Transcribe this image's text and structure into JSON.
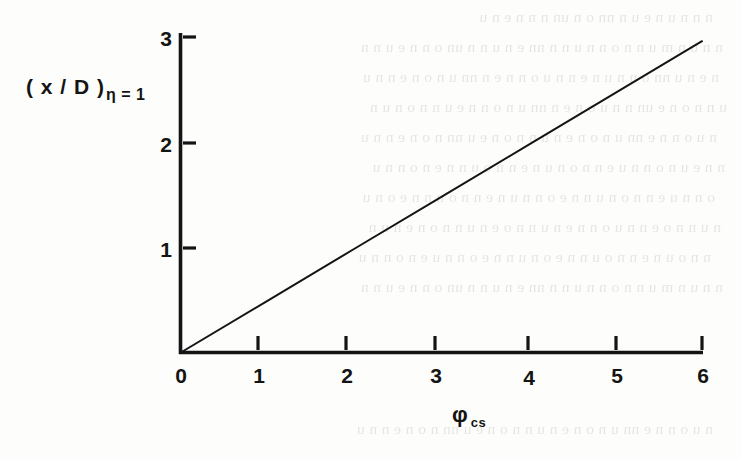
{
  "figure": {
    "background_color": "#fdfdfc",
    "ink_color": "#141414",
    "width": 741,
    "height": 459
  },
  "axes": {
    "y_title_main": "( x / D )",
    "y_title_subscript": "η = 1",
    "x_title_main": "φ",
    "x_title_subscript": "cs",
    "x_ticks": [
      "0",
      "1",
      "2",
      "3",
      "4",
      "5",
      "6"
    ],
    "y_ticks": [
      "1",
      "2",
      "3"
    ]
  },
  "ghost_text": {
    "note": "faint bleed-through text from reverse of scanned page (illegible)",
    "lines": [
      "n  n  n  u  n  e  u  n  nn  o  n  un  n  n  n  e  n  u",
      "n n u n m u n n o n n u n n nn e n u n n un o n n e u n n",
      "n e n u nn o n n u n e n n u o n n e n nn u n o n e n n u",
      "u n n o n e un n n u o n e n nn u n o n n e u n n o n u n",
      "n u o n n e nn u n o n e n u n n o n e u nn n o n e n n u",
      "n n e u n o n n u e n n o n u n e n n o u n n e n o n n u",
      "o n n u e n n o n u n n e o n n u n e n n o u n n e o n u",
      "n u n n o e n n u o n n e n u n n o e n u n n o n e n u n",
      "n n o u n e n n o u n n e o n u n n e o n n u e n o n n u"
    ]
  },
  "chart_data": {
    "type": "line",
    "title": "",
    "xlabel": "φ_cs",
    "ylabel": "(x/D)_η=1",
    "xlim": [
      0,
      6
    ],
    "ylim": [
      0,
      3
    ],
    "xticks": [
      0,
      1,
      2,
      3,
      4,
      5,
      6
    ],
    "yticks": [
      1,
      2,
      3
    ],
    "grid": false,
    "legend": null,
    "series": [
      {
        "name": "(x/D) at η = 1",
        "x": [
          0,
          1,
          2,
          3,
          4,
          5,
          6
        ],
        "y": [
          0.0,
          0.493,
          0.987,
          1.48,
          1.973,
          2.467,
          2.96
        ],
        "relation": "linear through origin, slope ≈ 0.493",
        "color": "#141414",
        "line_width": 2,
        "marker": "none"
      }
    ]
  }
}
